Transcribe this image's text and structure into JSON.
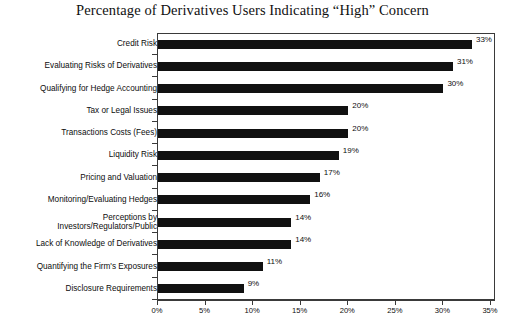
{
  "chart_data": {
    "type": "bar",
    "orientation": "horizontal",
    "title": "Percentage of Derivatives Users Indicating “High” Concern",
    "xlabel": "",
    "ylabel": "",
    "xlim": [
      0,
      35
    ],
    "grid": false,
    "legend": null,
    "bar_color": "#111111",
    "axis_color": "#3a3a3a",
    "xticks": [
      0,
      5,
      10,
      15,
      20,
      25,
      30,
      35
    ],
    "xticklabels": [
      "0%",
      "5%",
      "10%",
      "15%",
      "20%",
      "25%",
      "30%",
      "35%"
    ],
    "categories": [
      "Credit Risk",
      "Evaluating Risks of Derivatives",
      "Qualifying for Hedge Accounting",
      "Tax or Legal Issues",
      "Transactions Costs (Fees)",
      "Liquidity Risk",
      "Pricing and Valuation",
      "Monitoring/Evaluating Hedges",
      "Perceptions by\nInvestors/Regulators/Public",
      "Lack of Knowledge of Derivatives",
      "Quantifying the Firm's Exposures",
      "Disclosure Requirements"
    ],
    "values": [
      33,
      31,
      30,
      20,
      20,
      19,
      17,
      16,
      14,
      14,
      11,
      9
    ],
    "data_labels": [
      "33%",
      "31%",
      "30%",
      "20%",
      "20%",
      "19%",
      "17%",
      "16%",
      "14%",
      "14%",
      "11%",
      "9%"
    ]
  }
}
